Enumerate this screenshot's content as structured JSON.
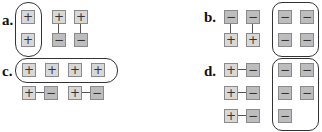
{
  "colors": {
    "positive_tile": "#d8d8d8",
    "negative_tile": "#bdbdbd",
    "tile_border": "#8a8a8a",
    "outline": "#333333"
  },
  "panels": {
    "a": {
      "label": "a.",
      "grouped_tiles": [
        "+",
        "+"
      ],
      "zero_pairs": [
        [
          "+",
          "−"
        ],
        [
          "+",
          "−"
        ]
      ],
      "pair_orientation": "vertical"
    },
    "b": {
      "label": "b.",
      "zero_pairs": [
        [
          "−",
          "+"
        ],
        [
          "−",
          "+"
        ]
      ],
      "grouped_tiles": [
        "−",
        "−",
        "−",
        "−"
      ],
      "pair_orientation": "vertical"
    },
    "c": {
      "label": "c.",
      "grouped_tiles": [
        "+",
        "+",
        "+",
        "+"
      ],
      "zero_pairs": [
        [
          "+",
          "−"
        ],
        [
          "+",
          "−"
        ]
      ],
      "pair_orientation": "horizontal"
    },
    "d": {
      "label": "d.",
      "zero_pairs": [
        [
          "+",
          "−"
        ],
        [
          "+",
          "−"
        ],
        [
          "+",
          "−"
        ]
      ],
      "grouped_tiles": [
        "−",
        "−",
        "−",
        "−",
        "−"
      ],
      "pair_orientation": "horizontal"
    }
  }
}
